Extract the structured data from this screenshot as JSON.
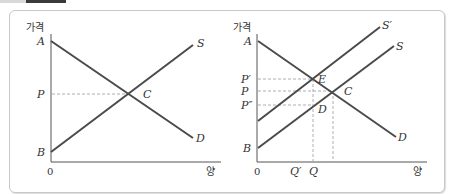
{
  "header": {
    "tab_colors": [
      "#d9d9d9",
      "#3a3a3a"
    ],
    "caption_partial": "…"
  },
  "colors": {
    "curve": "#4a4a4a",
    "axis": "#555555",
    "guide": "#999999",
    "panel_border": "#c8c8c8"
  },
  "left_chart": {
    "y_axis_label": "가격",
    "x_axis_label": "양",
    "origin_label": "0",
    "y_labels": {
      "a": "A",
      "p": "P",
      "b": "B"
    },
    "points": {
      "c": "C"
    },
    "curve_labels": {
      "supply": "S",
      "demand": "D"
    }
  },
  "right_chart": {
    "y_axis_label": "가격",
    "x_axis_label": "양",
    "origin_label": "0",
    "y_labels": {
      "a": "A",
      "p_prime": "P′",
      "p": "P",
      "p_double_prime": "P″",
      "b": "B"
    },
    "x_labels": {
      "q_prime": "Q′",
      "q": "Q"
    },
    "points": {
      "e": "E",
      "c": "C",
      "d": "D"
    },
    "curve_labels": {
      "supply_shifted": "S′",
      "supply": "S",
      "demand": "D"
    }
  }
}
